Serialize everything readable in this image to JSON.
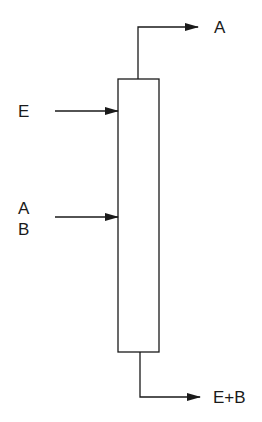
{
  "diagram": {
    "type": "extraction-column",
    "column": {
      "name": "column"
    },
    "streams": [
      {
        "id": "solvent-inlet",
        "direction": "in",
        "label_lines": [
          "E"
        ],
        "position": "upper-left"
      },
      {
        "id": "feed-inlet",
        "direction": "in",
        "label_lines": [
          "A",
          "B"
        ],
        "position": "middle-left"
      },
      {
        "id": "top-outlet",
        "direction": "out",
        "label_lines": [
          "A"
        ],
        "position": "top"
      },
      {
        "id": "bottom-outlet",
        "direction": "out",
        "label_lines": [
          "E+B"
        ],
        "position": "bottom"
      }
    ],
    "colors": {
      "line": "#1a1a1a",
      "background": "#ffffff"
    }
  }
}
